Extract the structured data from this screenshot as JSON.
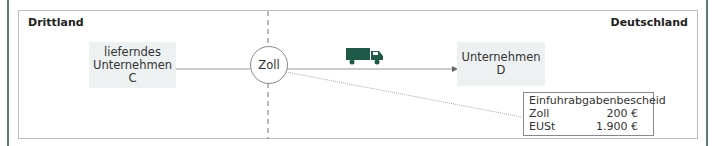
{
  "diagram": {
    "regions": {
      "left": "Drittland",
      "right": "Deutschland"
    },
    "nodes": {
      "supplier": {
        "line1": "lieferndes",
        "line2": "Unternehmen",
        "line3": "C"
      },
      "customs": "Zoll",
      "recipient": {
        "line1": "Unternehmen",
        "line2": "D"
      }
    },
    "transport_icon": "truck-icon",
    "notice": {
      "title": "Einfuhrabgabenbescheid",
      "rows": [
        {
          "label": "Zoll",
          "value": "200 €"
        },
        {
          "label": "EUSt",
          "value": "1.900 €"
        }
      ]
    },
    "colors": {
      "accent": "#1e5a47",
      "frame": "#5f7a72",
      "node_bg": "#eef1f2"
    }
  }
}
